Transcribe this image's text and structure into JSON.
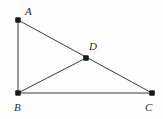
{
  "figure": {
    "kind": "euclidean-geometry-diagram",
    "canvas": {
      "width": 163,
      "height": 119
    },
    "background_color": "#fefefe",
    "stroke_color": "#3a3a3a",
    "dot_color": "#1a1a1a",
    "label_color": "#2b2b2b",
    "points": [
      {
        "id": "A",
        "label": "A",
        "x": 18,
        "y": 20,
        "label_x": 25,
        "label_y": 15
      },
      {
        "id": "B",
        "label": "B",
        "x": 18,
        "y": 93,
        "label_x": 14,
        "label_y": 111
      },
      {
        "id": "C",
        "label": "C",
        "x": 152,
        "y": 93,
        "label_x": 145,
        "label_y": 111
      },
      {
        "id": "D",
        "label": "D",
        "x": 86,
        "y": 58,
        "label_x": 89,
        "label_y": 50
      }
    ],
    "segments": [
      {
        "id": "AB",
        "from": "A",
        "to": "B",
        "x1": 18,
        "y1": 20,
        "x2": 18,
        "y2": 93
      },
      {
        "id": "AC",
        "from": "A",
        "to": "C",
        "x1": 18,
        "y1": 20,
        "x2": 152,
        "y2": 93
      },
      {
        "id": "BC",
        "from": "B",
        "to": "C",
        "x1": 18,
        "y1": 93,
        "x2": 152,
        "y2": 93
      },
      {
        "id": "BD",
        "from": "B",
        "to": "D",
        "x1": 18,
        "y1": 93,
        "x2": 86,
        "y2": 58
      }
    ]
  }
}
